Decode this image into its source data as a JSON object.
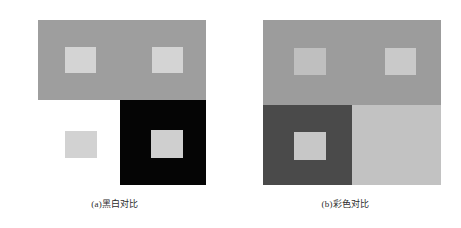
{
  "figure": {
    "background_color": "#ffffff",
    "panels": [
      {
        "id": "a",
        "caption": "(a)黑白对比",
        "caption_label": "(a)",
        "caption_text": "黑白对比",
        "description": "Black and white simultaneous contrast demonstration",
        "regions": [
          {
            "name": "gray-band",
            "color": "#9e9e9e",
            "role": "medium gray surround"
          },
          {
            "name": "square-top-left",
            "color": "#d4d4d4",
            "role": "light patch on gray"
          },
          {
            "name": "square-top-right",
            "color": "#d4d4d4",
            "role": "light patch on gray"
          },
          {
            "name": "black-block",
            "color": "#050505",
            "role": "black surround"
          },
          {
            "name": "square-in-black",
            "color": "#cfcfcf",
            "role": "light patch on black"
          },
          {
            "name": "square-on-white",
            "color": "#d2d2d2",
            "role": "light patch on white"
          }
        ]
      },
      {
        "id": "b",
        "caption": "(b)彩色对比",
        "caption_label": "(b)",
        "caption_text": "彩色对比",
        "description": "Color simultaneous contrast demonstration",
        "regions": [
          {
            "name": "gray-band",
            "color": "#9c9c9c",
            "role": "medium gray surround"
          },
          {
            "name": "square-top-left",
            "color": "#bfbfbf",
            "role": "light patch on gray"
          },
          {
            "name": "square-top-right",
            "color": "#c9c9c9",
            "role": "light patch on gray"
          },
          {
            "name": "dark-block",
            "color": "#4a4a4a",
            "role": "dark surround"
          },
          {
            "name": "light-block",
            "color": "#c2c2c2",
            "role": "light surround"
          },
          {
            "name": "square-in-dark",
            "color": "#c7c7c7",
            "role": "light patch on dark"
          }
        ]
      }
    ]
  }
}
